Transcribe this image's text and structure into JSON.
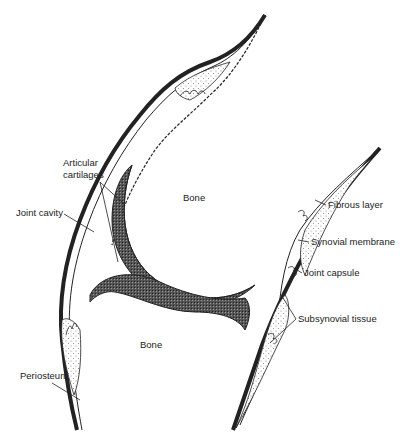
{
  "diagram": {
    "labels": {
      "articular_cartilages_line1": "Articular",
      "articular_cartilages_line2": "cartilages",
      "joint_cavity": "Joint cavity",
      "bone_upper": "Bone",
      "bone_lower": "Bone",
      "fibrous_layer": "Fibrous layer",
      "synovial_membrane": "Synovial membrane",
      "joint_capsule": "Joint capsule",
      "subsynovial_tissue": "Subsynovial tissue",
      "periosteum": "Periosteum"
    },
    "colors": {
      "background": "#ffffff",
      "ink": "#222222",
      "cartilage": "#3a3a3a",
      "stipple": "#888888"
    }
  }
}
